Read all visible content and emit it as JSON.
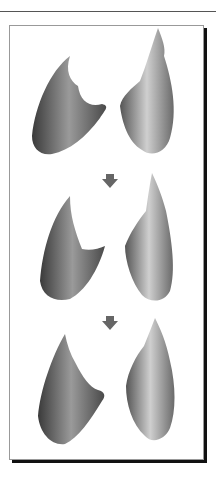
{
  "figure": {
    "rows": [
      {
        "label": "stage-1",
        "left_shape": "3d-mesh-left",
        "right_shape": "3d-mesh-right"
      },
      {
        "label": "stage-2",
        "left_shape": "3d-mesh-left",
        "right_shape": "3d-mesh-right"
      },
      {
        "label": "stage-3",
        "left_shape": "3d-mesh-left",
        "right_shape": "3d-mesh-right"
      }
    ],
    "arrows": [
      "down-arrow-icon",
      "down-arrow-icon"
    ],
    "colors": {
      "arrow": "#666666",
      "shape_dark": "#3a3a3a",
      "shape_light": "#d8d8d8",
      "frame_shadow": "#111111"
    }
  }
}
